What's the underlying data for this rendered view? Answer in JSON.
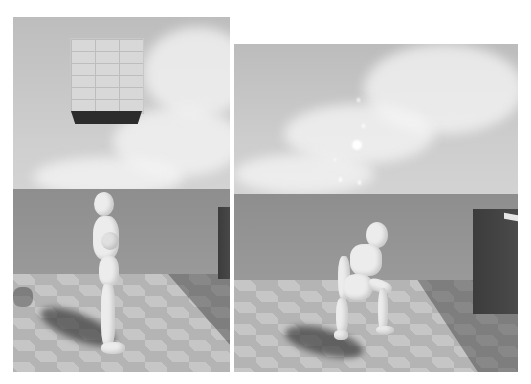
{
  "figure": {
    "panels": [
      {
        "id": "left",
        "description": "Game-engine render: white mannequin character standing upright on a checkered floor, a floating brick block above, sky with clouds, dark wall at right edge",
        "objects": [
          "sky",
          "clouds",
          "brick-block",
          "sea-horizon",
          "checkered-floor",
          "mannequin-standing",
          "character-shadow",
          "dark-wall"
        ]
      },
      {
        "id": "right",
        "description": "Game-engine render: white mannequin character crouching/landing on a checkered floor with particle sparks above, dark block at right",
        "objects": [
          "sky",
          "clouds",
          "particle-sparks",
          "sea-horizon",
          "checkered-floor",
          "mannequin-crouching",
          "character-shadow",
          "dark-block"
        ]
      }
    ],
    "colors": {
      "background": "#ffffff",
      "sky": "#c4c4c4",
      "sea": "#939393",
      "floor_light": "#c6c6c6",
      "floor_dark": "#b4b4b4",
      "wall": "#404040",
      "mannequin": "#ececec"
    }
  }
}
